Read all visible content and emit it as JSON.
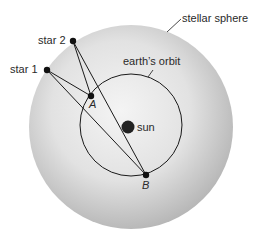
{
  "diagram": {
    "labels": {
      "stellar_sphere": "stellar sphere",
      "earths_orbit": "earth’s orbit",
      "sun": "sun",
      "star1": "star 1",
      "star2": "star 2",
      "point_a": "A",
      "point_b": "B"
    },
    "colors": {
      "sphere_center": "#f2f2f2",
      "sphere_edge": "#b5b5b5",
      "line": "#1a1a1a",
      "sun": "#222222",
      "text": "#2a2a2a"
    },
    "sight_lines": [
      {
        "from": "star1",
        "to": "A"
      },
      {
        "from": "star1",
        "to": "B"
      },
      {
        "from": "star2",
        "to": "A"
      },
      {
        "from": "star2",
        "to": "B"
      }
    ]
  }
}
